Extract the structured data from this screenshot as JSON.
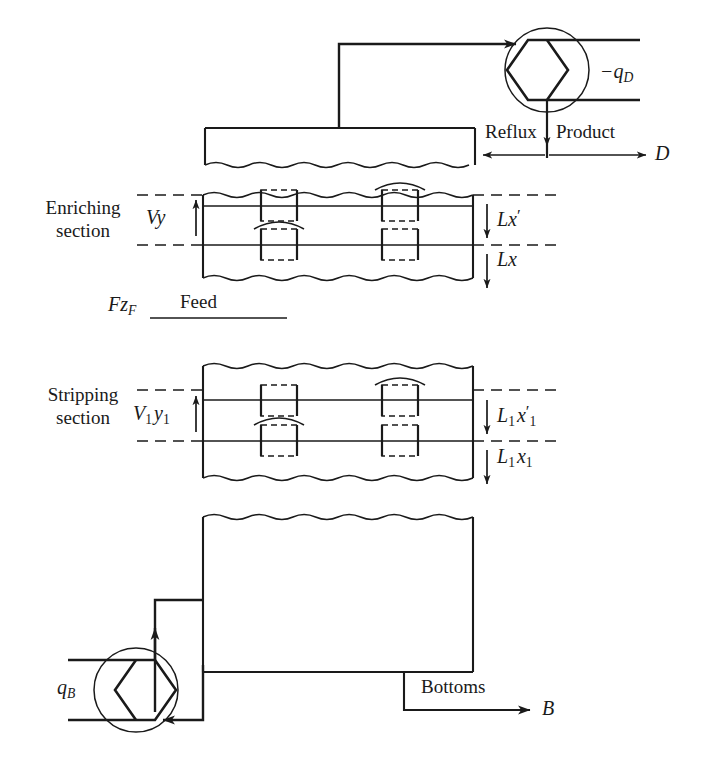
{
  "figure": {
    "type": "process-flow-diagram",
    "line_color": "#1a1a1a",
    "background_color": "#ffffff"
  },
  "labels": {
    "heat_removed_condenser": "−q",
    "heat_removed_condenser_sub": "D",
    "reflux": "Reflux",
    "product": "Product",
    "distillate": "D",
    "enriching_section_line1": "Enriching",
    "enriching_section_line2": "section",
    "vapor_enriching": "Vy",
    "liquid_enriching_prime": "Lx",
    "liquid_enriching_prime_mark": "′",
    "liquid_enriching": "Lx",
    "feed_rate": "F",
    "feed_rate_sub": "z",
    "feed_rate_sub2": "F",
    "feed": "Feed",
    "stripping_section_line1": "Stripping",
    "stripping_section_line2": "section",
    "vapor_stripping": "V",
    "vapor_stripping_sub": "1",
    "vapor_stripping_y": "y",
    "vapor_stripping_y_sub": "1",
    "liquid_stripping_prime": "L",
    "liquid_stripping_prime_sub": "1",
    "liquid_stripping_prime_x": "x",
    "liquid_stripping_prime_mark": "′",
    "liquid_stripping_prime_xsub": "1",
    "liquid_stripping": "L",
    "liquid_stripping_sub": "1",
    "liquid_stripping_x": "x",
    "liquid_stripping_xsub": "1",
    "heat_added_reboiler": "q",
    "heat_added_reboiler_sub": "B",
    "bottoms": "Bottoms",
    "bottoms_stream": "B"
  },
  "arrows": {
    "overhead_vapor": "right",
    "reflux_to_accumulator": "left",
    "product_out": "right",
    "product_down": "down",
    "vapor_up_enriching": "up",
    "liquid_down_enriching_1": "down",
    "liquid_down_enriching_2": "down",
    "vapor_up_stripping": "up",
    "liquid_down_stripping_1": "down",
    "liquid_down_stripping_2": "down",
    "reboiler_vapor_up": "up",
    "reboiler_liquid_in": "left",
    "bottoms_out": "right"
  }
}
